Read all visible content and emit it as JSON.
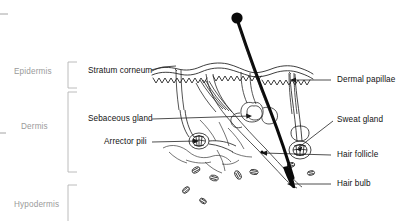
{
  "diagram": {
    "background_color": "#ffffff",
    "ink_color": "#121212",
    "bracket_color": "#b4b4b4",
    "layer_label_color": "#9a9a9a",
    "part_label_color": "#121212"
  },
  "layers": [
    {
      "id": "epidermis",
      "label": "Epidermis",
      "x": 14,
      "y": 68,
      "bracket": {
        "x": 68,
        "top": 62,
        "bottom": 88,
        "arm": 9,
        "open": "both"
      }
    },
    {
      "id": "dermis",
      "label": "Dermis",
      "x": 21,
      "y": 123,
      "bracket": {
        "x": 68,
        "top": 92,
        "bottom": 172,
        "arm": 9,
        "open": "both"
      }
    },
    {
      "id": "hypodermis",
      "label": "Hypodermis",
      "x": 14,
      "y": 201,
      "bracket": {
        "x": 68,
        "top": 185,
        "bottom": 221,
        "arm": 9,
        "open": "top"
      }
    }
  ],
  "parts": [
    {
      "id": "stratum-corneum",
      "label": "Stratum corneum",
      "side": "left",
      "x": 88,
      "y": 67,
      "leader": {
        "from": [
          151,
          70
        ],
        "to": [
          176,
          68
        ],
        "arrow": false
      }
    },
    {
      "id": "sebaceous-gland",
      "label": "Sebaceous gland",
      "side": "left",
      "x": 88,
      "y": 115,
      "leader": {
        "from": [
          152,
          119
        ],
        "to": [
          247,
          116
        ],
        "arrow": true
      }
    },
    {
      "id": "arrector-pili",
      "label": "Arrector pili",
      "side": "left",
      "x": 104,
      "y": 138,
      "leader": {
        "from": [
          152,
          142
        ],
        "to": [
          196,
          141
        ],
        "arrow": true
      }
    },
    {
      "id": "dermal-papillae",
      "label": "Dermal papillae",
      "side": "right",
      "x": 337,
      "y": 76,
      "leader": {
        "from": [
          331,
          80
        ],
        "to": [
          290,
          80
        ],
        "arrow": true
      }
    },
    {
      "id": "sweat-gland",
      "label": "Sweat gland",
      "side": "right",
      "x": 337,
      "y": 116,
      "leader": {
        "from": [
          333,
          121
        ],
        "to": [
          297,
          147
        ],
        "arrow": true
      }
    },
    {
      "id": "hair-follicle",
      "label": "Hair follicle",
      "side": "right",
      "x": 337,
      "y": 151,
      "leader": {
        "from": [
          331,
          155
        ],
        "to": [
          262,
          154
        ],
        "arrow": true
      }
    },
    {
      "id": "hair-bulb",
      "label": "Hair bulb",
      "side": "right",
      "x": 337,
      "y": 180,
      "leader": {
        "from": [
          331,
          184
        ],
        "to": [
          287,
          184
        ],
        "arrow": true
      }
    }
  ],
  "structures": [
    {
      "id": "hair-shaft",
      "name": "hair shaft"
    },
    {
      "id": "hair-tip",
      "name": "hair shaft tip"
    },
    {
      "id": "epidermis-surface",
      "name": "wavy epidermal surface"
    },
    {
      "id": "dermal-papillae-ridges",
      "name": "dermal papillae ridges"
    },
    {
      "id": "follicle-wall",
      "name": "hair follicle wall"
    },
    {
      "id": "sebaceous-gland-lobes",
      "name": "sebaceous gland lobes"
    },
    {
      "id": "arrector-pili-muscle",
      "name": "arrector pili muscle"
    },
    {
      "id": "sweat-gland-coil",
      "name": "sweat gland coil"
    },
    {
      "id": "sweat-duct",
      "name": "sweat duct"
    },
    {
      "id": "adipocytes",
      "name": "subcutaneous fat cells"
    }
  ]
}
